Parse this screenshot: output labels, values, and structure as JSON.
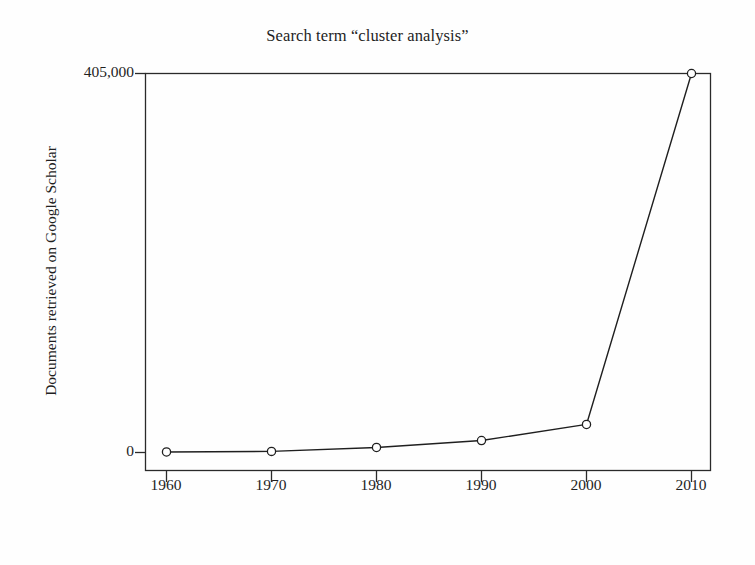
{
  "chart_data": {
    "type": "line",
    "title": "Search term “cluster analysis”",
    "xlabel": "Decade to end 50s, 60s, 70s, 80s, 90s, 00s",
    "ylabel": "Documents retrieved on Google Scholar",
    "x": [
      1960,
      1970,
      1980,
      1990,
      2000,
      2010
    ],
    "xtick_labels": [
      "1960",
      "1970",
      "1980",
      "1990",
      "2000",
      "2010"
    ],
    "ytick_labels": [
      "0",
      "405,000"
    ],
    "values": [
      600,
      1200,
      5400,
      12800,
      30000,
      405000
    ],
    "series": [
      {
        "name": "Documents retrieved on Google Scholar",
        "values": [
          600,
          1200,
          5400,
          12800,
          30000,
          405000
        ]
      }
    ],
    "xlim": [
      1955,
      2015
    ],
    "ylim": [
      0,
      405000
    ],
    "grid": false,
    "legend": false,
    "marker": "open-circle",
    "line_color": "#1f1f1f",
    "marker_fill": "#ffffff",
    "frame": "box"
  },
  "axes": {
    "y_top_label": "405,000",
    "y_zero_label": "0",
    "x_ticks": [
      "1960",
      "1970",
      "1980",
      "1990",
      "2000",
      "2010"
    ]
  },
  "colors": {
    "ink": "#1f1f1f",
    "background": "#fefefe",
    "marker_fill": "#ffffff"
  }
}
